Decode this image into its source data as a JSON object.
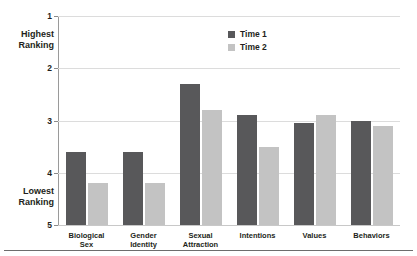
{
  "chart_data": {
    "type": "bar",
    "title": "",
    "subtitle": "",
    "xlabel": "",
    "ylabel": "",
    "categories": [
      "Biological Sex",
      "Gender Identity",
      "Sexual Attraction",
      "Intentions",
      "Values",
      "Behaviors"
    ],
    "category_lines": [
      [
        "Biological",
        "Sex"
      ],
      [
        "Gender",
        "Identity"
      ],
      [
        "Sexual",
        "Attraction"
      ],
      [
        "Intentions"
      ],
      [
        "Values"
      ],
      [
        "Behaviors"
      ]
    ],
    "series": [
      {
        "name": "Time 1",
        "color": "#58585a",
        "values": [
          3.6,
          3.6,
          2.3,
          2.9,
          3.05,
          3.0
        ]
      },
      {
        "name": "Time 2",
        "color": "#c3c3c3",
        "values": [
          4.2,
          4.2,
          2.8,
          3.5,
          2.9,
          3.1
        ]
      }
    ],
    "ylim": [
      1,
      5
    ],
    "y_inverted": true,
    "yticks": [
      1,
      2,
      3,
      4,
      5
    ],
    "ytick_labels": [
      "1",
      "2",
      "3",
      "4",
      "5"
    ],
    "grid": true,
    "legend_position": "top-center"
  },
  "axis": {
    "top_caption_lines": [
      "Highest",
      "Ranking"
    ],
    "bottom_caption_lines": [
      "Lowest",
      "Ranking"
    ]
  },
  "legend": {
    "items": [
      {
        "label": "Time 1",
        "color": "#58585a"
      },
      {
        "label": "Time 2",
        "color": "#c3c3c3"
      }
    ]
  },
  "colors": {
    "time1": "#58585a",
    "time2": "#c3c3c3",
    "grid": "#dcdcdc",
    "axis": "#9a9a9a",
    "text": "#231f20",
    "rule": "#6d6d6d"
  }
}
